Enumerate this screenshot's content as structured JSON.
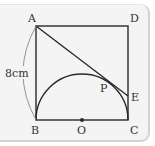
{
  "figure": {
    "points": {
      "A": {
        "label": "A",
        "x": 36,
        "y": 26
      },
      "D": {
        "label": "D",
        "x": 128,
        "y": 26
      },
      "B": {
        "label": "B",
        "x": 36,
        "y": 120
      },
      "C": {
        "label": "C",
        "x": 128,
        "y": 120
      },
      "O": {
        "label": "O",
        "x": 82,
        "y": 120
      },
      "E": {
        "label": "E",
        "x": 128,
        "y": 96
      },
      "P": {
        "label": "P",
        "x": 103,
        "y": 77
      }
    },
    "dimension_label": "8cm",
    "colors": {
      "line": "#2a2a2a",
      "arc": "#888888",
      "background": "#f4f4f4"
    }
  }
}
